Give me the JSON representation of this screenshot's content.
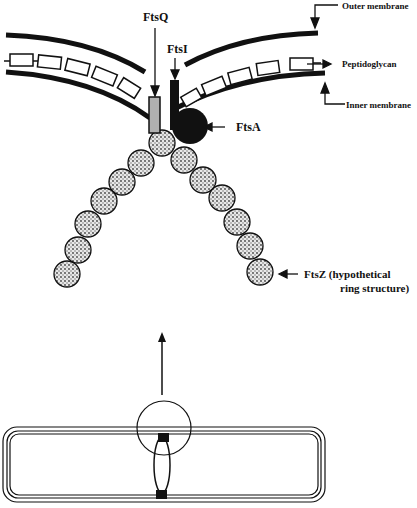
{
  "labels": {
    "ftsq": "FtsQ",
    "ftsi": "FtsI",
    "ftsa": "FtsA",
    "ftsz_line1": "FtsZ  (hypothetical",
    "ftsz_line2": "ring structure)",
    "outer_membrane": "Outer membrane",
    "peptidoglycan": "Peptidoglycan",
    "inner_membrane": "Inner membrane"
  },
  "colors": {
    "ink": "#111111",
    "ftsq_fill": "#b0b0b0",
    "ftsz_fill": "#cfcfcf"
  }
}
